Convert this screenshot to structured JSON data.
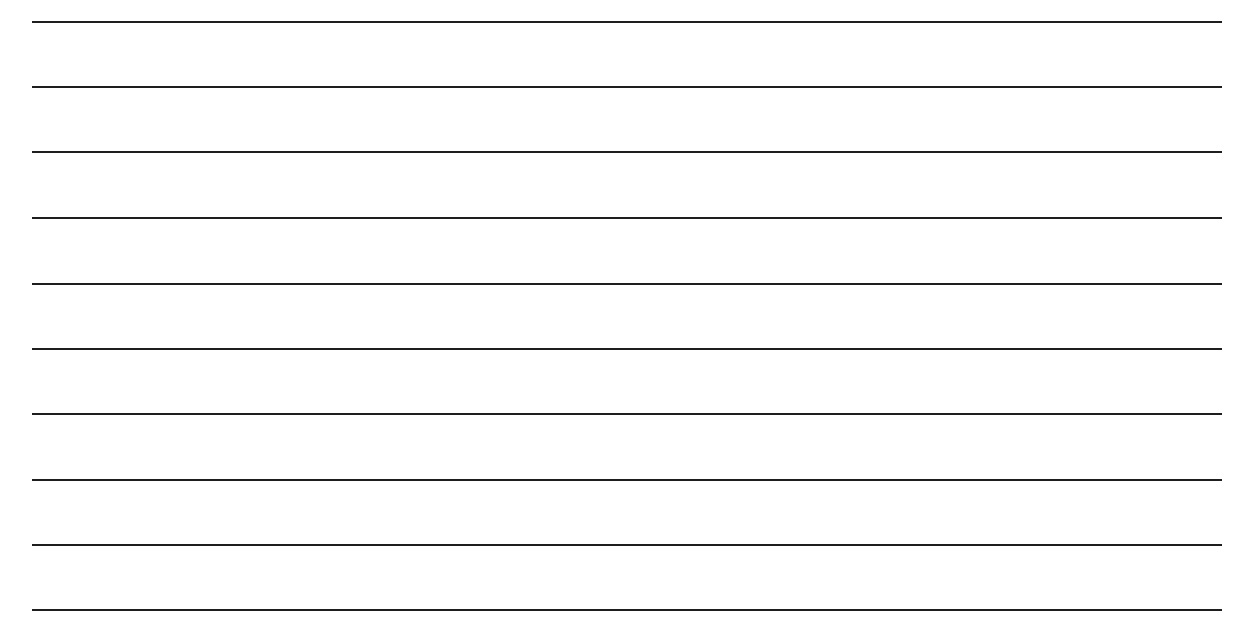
{
  "page": {
    "type": "lined-paper",
    "background": "#ffffff",
    "line_color": "#1e1e1e",
    "line_count": 10,
    "lines": [
      {
        "y": 22
      },
      {
        "y": 87
      },
      {
        "y": 152
      },
      {
        "y": 218
      },
      {
        "y": 284
      },
      {
        "y": 349
      },
      {
        "y": 414
      },
      {
        "y": 480
      },
      {
        "y": 545
      },
      {
        "y": 610
      }
    ]
  }
}
